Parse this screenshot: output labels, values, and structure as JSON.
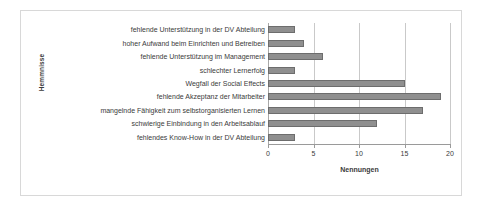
{
  "chart_data": {
    "type": "bar",
    "orientation": "horizontal",
    "title": "",
    "xlabel": "Nennungen",
    "ylabel": "Hemmnisse",
    "xlim": [
      0,
      20
    ],
    "ylim": null,
    "grid": true,
    "legend": false,
    "xticks": [
      "0",
      "5",
      "10",
      "15",
      "20"
    ],
    "xtick_values": [
      0,
      5,
      10,
      15,
      20
    ],
    "categories": [
      "fehlende Unterstützung in der DV Abteilung",
      "hoher Aufwand beim Einrichten und Betreiben",
      "fehlende Unterstützung im Management",
      "schlechter Lernerfolg",
      "Wegfall der Social Effects",
      "fehlende Akzeptanz der Mitarbeiter",
      "mangelnde Fähigkeit zum selbstorganisierten Lernen",
      "schwierige Einbindung in den Arbeitsablauf",
      "fehlendes Know-How in der DV Abteilung"
    ],
    "values": [
      3,
      4,
      6,
      3,
      15,
      19,
      17,
      12,
      3
    ],
    "bar_color": "#8f8f8f",
    "bar_edge_color": "#6d6d6d",
    "gridline_color": "#c9c9c9",
    "axis_color": "#9a9a9a",
    "frame_color": "#d8d8d8",
    "text_color": "#3b3b3b"
  }
}
